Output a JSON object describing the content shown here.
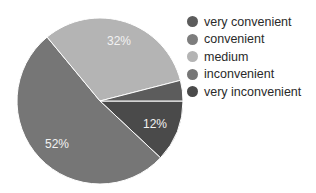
{
  "chart_data": {
    "type": "pie",
    "title": "",
    "categories": [
      "very convenient",
      "convenient",
      "medium",
      "inconvenient",
      "very inconvenient"
    ],
    "values": [
      4,
      0,
      32,
      52,
      12
    ],
    "labels_shown": {
      "medium": "32%",
      "inconvenient": "52%",
      "very inconvenient": "12%"
    },
    "colors": [
      "#5c5c5c",
      "#7d7d7d",
      "#b4b4b4",
      "#767676",
      "#4a4a4a"
    ],
    "legend_position": "right"
  },
  "legend": [
    {
      "label": "very convenient",
      "color": "#5c5c5c"
    },
    {
      "label": "convenient",
      "color": "#7d7d7d"
    },
    {
      "label": "medium",
      "color": "#b4b4b4"
    },
    {
      "label": "inconvenient",
      "color": "#767676"
    },
    {
      "label": "very inconvenient",
      "color": "#4a4a4a"
    }
  ],
  "slice_labels": {
    "medium": "32%",
    "inconvenient": "52%",
    "very_inconvenient": "12%"
  }
}
